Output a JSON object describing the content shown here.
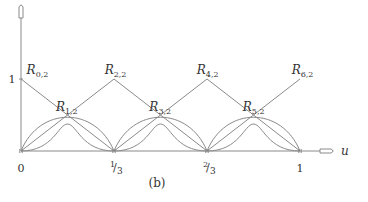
{
  "chart_data": {
    "type": "line",
    "title": "",
    "caption": "(b)",
    "xlabel": "u",
    "ylabel": "",
    "xlim": [
      0,
      1
    ],
    "ylim": [
      0,
      1
    ],
    "x_ticks": [
      {
        "value": 0,
        "label": "0"
      },
      {
        "value": 0.3333,
        "label": "1/3"
      },
      {
        "value": 0.6667,
        "label": "2/3"
      },
      {
        "value": 1,
        "label": "1"
      }
    ],
    "y_ticks": [
      {
        "value": 1,
        "label": "1"
      }
    ],
    "series": [
      {
        "name": "R0,2",
        "kind": "linear",
        "points": [
          [
            0,
            1
          ],
          [
            0.3333,
            0
          ]
        ]
      },
      {
        "name": "R2,2",
        "kind": "linear",
        "points": [
          [
            0,
            0
          ],
          [
            0.3333,
            1
          ],
          [
            0.6667,
            0
          ]
        ]
      },
      {
        "name": "R4,2",
        "kind": "linear",
        "points": [
          [
            0.3333,
            0
          ],
          [
            0.6667,
            1
          ],
          [
            1,
            0
          ]
        ]
      },
      {
        "name": "R6,2",
        "kind": "linear",
        "points": [
          [
            0.6667,
            0
          ],
          [
            1,
            1
          ]
        ]
      },
      {
        "name": "R1,2",
        "kind": "smooth",
        "interval": [
          0,
          0.3333
        ],
        "peak": 0.375
      },
      {
        "name": "R3,2",
        "kind": "smooth",
        "interval": [
          0.3333,
          0.6667
        ],
        "peak": 0.375
      },
      {
        "name": "R5,2",
        "kind": "smooth",
        "interval": [
          0.6667,
          1
        ],
        "peak": 0.375
      }
    ],
    "labels": [
      {
        "text": "R",
        "sub": "0,2",
        "u": 0.02,
        "v": 1.07
      },
      {
        "text": "R",
        "sub": "1,2",
        "u": 0.125,
        "v": 0.55
      },
      {
        "text": "R",
        "sub": "2,2",
        "u": 0.3,
        "v": 1.07
      },
      {
        "text": "R",
        "sub": "3,2",
        "u": 0.46,
        "v": 0.55
      },
      {
        "text": "R",
        "sub": "4,2",
        "u": 0.63,
        "v": 1.07
      },
      {
        "text": "R",
        "sub": "5,2",
        "u": 0.795,
        "v": 0.55
      },
      {
        "text": "R",
        "sub": "6,2",
        "u": 0.97,
        "v": 1.07
      }
    ]
  }
}
